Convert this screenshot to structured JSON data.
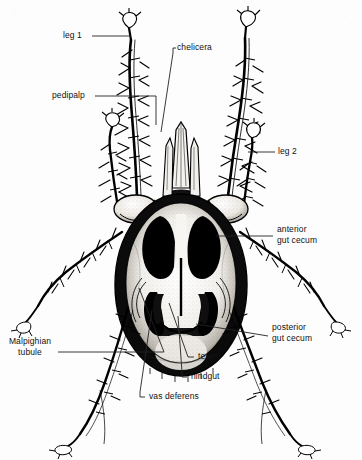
{
  "figure": {
    "view": "ventral",
    "style": "black-and-white stippled line drawing",
    "background_color": "#fdfdfd",
    "ink_color": "#000000",
    "leader_color": "#222222",
    "canvas": {
      "width": 362,
      "height": 460
    }
  },
  "labels": [
    {
      "id": "leg-1",
      "text": "leg 1",
      "x": 63,
      "y": 32,
      "align": "left",
      "leader": "M 92 36 L 131 36"
    },
    {
      "id": "pedipalp",
      "text": "pedipalp",
      "x": 52,
      "y": 92,
      "align": "left",
      "leader": "M 95 96 L 156 96 L 156 125"
    },
    {
      "id": "chelicera",
      "text": "chelicera",
      "x": 176,
      "y": 44,
      "align": "left",
      "leader": "M 173 53 L 173 48 L 176 48 M 173 53 L 161 132"
    },
    {
      "id": "leg-2",
      "text": "leg 2",
      "x": 278,
      "y": 147,
      "align": "left",
      "leader": "M 275 152 L 248 152"
    },
    {
      "id": "anterior-gut-cecum",
      "text": "anterior\ngut cecum",
      "x": 277,
      "y": 226,
      "align": "left",
      "leader": "M 273 236 L 216 236"
    },
    {
      "id": "posterior-gut-cecum",
      "text": "posterior\ngut cecum",
      "x": 272,
      "y": 324,
      "align": "left",
      "leader": "M 268 336 L 196 324"
    },
    {
      "id": "malpighian-tubule",
      "text": "Malpighian\ntubule",
      "x": 3,
      "y": 338,
      "align": "left",
      "leader": "M 58 352 L 164 352 L 139 288"
    },
    {
      "id": "testis",
      "text": "testis",
      "x": 197,
      "y": 353,
      "align": "left",
      "leader": "M 194 357 L 188 357 L 169 303"
    },
    {
      "id": "hindgut",
      "text": "hindgut",
      "x": 190,
      "y": 373,
      "align": "left",
      "leader": "M 187 377 L 182 377 L 182 372 L 178 316"
    },
    {
      "id": "vas-deferens",
      "text": "vas deferens",
      "x": 148,
      "y": 393,
      "align": "left",
      "leader": "M 145 397 L 140 397 L 140 392 L 152 310"
    }
  ],
  "anatomy_parts": [
    "leg 1",
    "pedipalp",
    "chelicera",
    "leg 2",
    "anterior gut cecum",
    "posterior gut cecum",
    "Malpighian tubule",
    "testis",
    "hindgut",
    "vas deferens"
  ]
}
